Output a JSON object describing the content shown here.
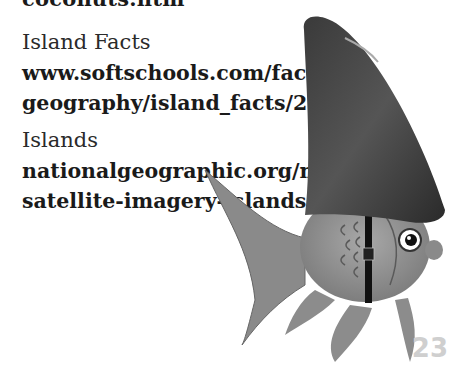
{
  "page": {
    "cut_off_text": "coconuts.htm",
    "resources": [
      {
        "label": "Island Facts",
        "url_lines": [
          "www.softschools.com/facts/",
          "geography/island_facts/2229/"
        ]
      },
      {
        "label": "Islands",
        "url_lines": [
          "nationalgeographic.org/media/",
          "satellite-imagery-islands/"
        ]
      }
    ],
    "page_number": "23",
    "illustration": "goldfish-wearing-shark-fin-icon"
  }
}
